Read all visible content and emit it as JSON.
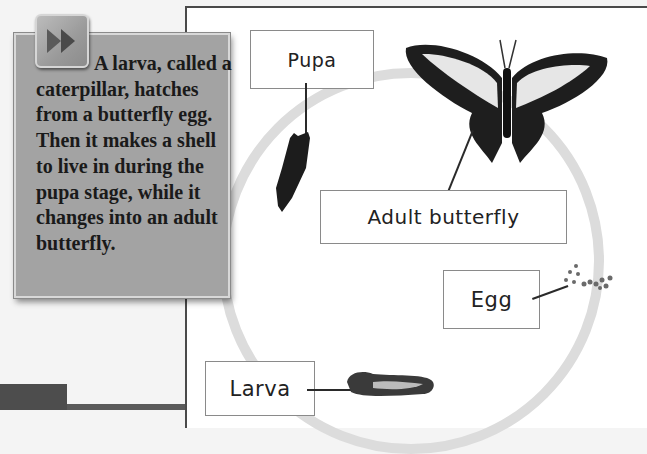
{
  "panel": {
    "text": "A larva, called a caterpillar, hatches from a butterfly egg. Then it makes a shell to live in during the pupa stage, while it changes into an adult butterfly.",
    "button_icon": "fast-forward-icon"
  },
  "diagram": {
    "stages": [
      {
        "label": "Pupa"
      },
      {
        "label": "Adult butterfly"
      },
      {
        "label": "Egg"
      },
      {
        "label": "Larva"
      }
    ],
    "ring_color": "#dcdcdc"
  }
}
